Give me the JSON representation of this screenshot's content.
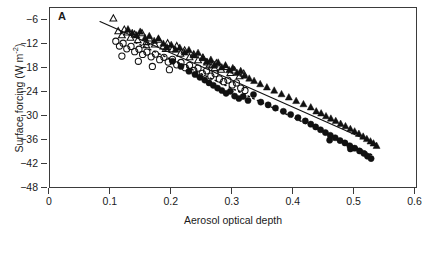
{
  "figure": {
    "panel_label": "A",
    "background": "#ffffff",
    "frame_color": "#3b3b3b",
    "marker_color": "#111111"
  },
  "axes": {
    "x": {
      "title": "Aerosol optical depth",
      "ticks": [
        "0",
        "0.1",
        "0.2",
        "0.3",
        "0.4",
        "0.5",
        "0.6"
      ],
      "tick_values": [
        0,
        0.1,
        0.2,
        0.3,
        0.4,
        0.5,
        0.6
      ],
      "min": 0,
      "max": 0.604
    },
    "y": {
      "title_main": "Surface forcing (W m",
      "title_sup": "-2",
      "title_tail": ")",
      "ticks": [
        "-6",
        "-12",
        "-18",
        "-24",
        "-30",
        "-36",
        "-42",
        "-48"
      ],
      "tick_values": [
        -6,
        -12,
        -18,
        -24,
        -30,
        -36,
        -42,
        -48
      ],
      "min": -48,
      "max": -2.8
    }
  },
  "chart_data": {
    "type": "scatter",
    "title": "",
    "subtitle": "",
    "xlabel": "Aerosol optical depth",
    "ylabel": "Surface forcing (W m-2)",
    "xlim": [
      0,
      0.604
    ],
    "ylim": [
      -48,
      -2.8
    ],
    "grid": false,
    "legend": "none",
    "panel": "A",
    "series": [
      {
        "name": "open-triangles",
        "marker": "triangle-open",
        "fit_line": "none",
        "points": [
          [
            0.104,
            -5.4
          ],
          [
            0.112,
            -8.6
          ],
          [
            0.118,
            -9.6
          ],
          [
            0.122,
            -8.2
          ],
          [
            0.127,
            -8.9
          ],
          [
            0.132,
            -10.2
          ],
          [
            0.139,
            -9.4
          ],
          [
            0.144,
            -10.8
          ],
          [
            0.151,
            -9.1
          ],
          [
            0.158,
            -11.3
          ],
          [
            0.163,
            -10.4
          ],
          [
            0.172,
            -11.9
          ],
          [
            0.178,
            -10.7
          ],
          [
            0.186,
            -12.4
          ],
          [
            0.193,
            -11.6
          ],
          [
            0.201,
            -13.1
          ],
          [
            0.208,
            -12.3
          ],
          [
            0.214,
            -14.2
          ],
          [
            0.221,
            -13.4
          ],
          [
            0.229,
            -15.1
          ],
          [
            0.236,
            -14.4
          ],
          [
            0.243,
            -15.8
          ],
          [
            0.251,
            -15.2
          ],
          [
            0.258,
            -16.4
          ],
          [
            0.266,
            -17.1
          ],
          [
            0.273,
            -16.6
          ],
          [
            0.281,
            -18.2
          ],
          [
            0.288,
            -17.5
          ],
          [
            0.296,
            -19.0
          ],
          [
            0.303,
            -18.4
          ],
          [
            0.311,
            -19.8
          ],
          [
            0.318,
            -19.2
          ],
          [
            0.262,
            -16.9
          ],
          [
            0.27,
            -17.8
          ],
          [
            0.158,
            -12.1
          ],
          [
            0.19,
            -13.0
          ]
        ]
      },
      {
        "name": "filled-triangles",
        "marker": "triangle-filled",
        "fit_line": "solid",
        "fit": {
          "x0": 0.082,
          "y0": -6.2,
          "x1": 0.536,
          "y1": -36.8
        },
        "points": [
          [
            0.128,
            -8.1
          ],
          [
            0.135,
            -9.0
          ],
          [
            0.142,
            -9.6
          ],
          [
            0.148,
            -8.7
          ],
          [
            0.156,
            -10.3
          ],
          [
            0.163,
            -9.8
          ],
          [
            0.171,
            -11.0
          ],
          [
            0.178,
            -10.4
          ],
          [
            0.186,
            -11.7
          ],
          [
            0.192,
            -12.6
          ],
          [
            0.199,
            -12.0
          ],
          [
            0.206,
            -13.2
          ],
          [
            0.213,
            -12.7
          ],
          [
            0.221,
            -13.9
          ],
          [
            0.228,
            -13.3
          ],
          [
            0.236,
            -14.6
          ],
          [
            0.243,
            -14.0
          ],
          [
            0.251,
            -15.3
          ],
          [
            0.257,
            -16.2
          ],
          [
            0.264,
            -15.7
          ],
          [
            0.27,
            -17.0
          ],
          [
            0.276,
            -16.4
          ],
          [
            0.282,
            -17.6
          ],
          [
            0.288,
            -17.1
          ],
          [
            0.294,
            -18.3
          ],
          [
            0.3,
            -17.8
          ],
          [
            0.307,
            -19.0
          ],
          [
            0.313,
            -18.5
          ],
          [
            0.319,
            -19.7
          ],
          [
            0.327,
            -20.4
          ],
          [
            0.335,
            -21.0
          ],
          [
            0.345,
            -21.8
          ],
          [
            0.356,
            -22.6
          ],
          [
            0.368,
            -23.4
          ],
          [
            0.38,
            -24.3
          ],
          [
            0.392,
            -25.1
          ],
          [
            0.404,
            -26.0
          ],
          [
            0.416,
            -26.8
          ],
          [
            0.428,
            -27.6
          ],
          [
            0.437,
            -28.6
          ],
          [
            0.445,
            -29.1
          ],
          [
            0.453,
            -29.8
          ],
          [
            0.461,
            -30.4
          ],
          [
            0.469,
            -31.0
          ],
          [
            0.477,
            -31.7
          ],
          [
            0.485,
            -32.3
          ],
          [
            0.493,
            -33.0
          ],
          [
            0.5,
            -33.6
          ],
          [
            0.507,
            -34.2
          ],
          [
            0.514,
            -34.9
          ],
          [
            0.52,
            -35.5
          ],
          [
            0.526,
            -36.1
          ],
          [
            0.531,
            -36.6
          ],
          [
            0.536,
            -37.2
          ]
        ]
      },
      {
        "name": "open-circles",
        "marker": "circle-open",
        "fit_line": "none",
        "points": [
          [
            0.108,
            -11.1
          ],
          [
            0.114,
            -12.3
          ],
          [
            0.12,
            -11.6
          ],
          [
            0.126,
            -13.0
          ],
          [
            0.133,
            -12.4
          ],
          [
            0.139,
            -13.7
          ],
          [
            0.146,
            -13.1
          ],
          [
            0.152,
            -14.4
          ],
          [
            0.159,
            -13.8
          ],
          [
            0.166,
            -15.0
          ],
          [
            0.173,
            -14.3
          ],
          [
            0.18,
            -15.7
          ],
          [
            0.187,
            -15.1
          ],
          [
            0.194,
            -16.3
          ],
          [
            0.201,
            -15.6
          ],
          [
            0.208,
            -17.0
          ],
          [
            0.215,
            -16.4
          ],
          [
            0.222,
            -17.7
          ],
          [
            0.229,
            -17.1
          ],
          [
            0.236,
            -18.4
          ],
          [
            0.243,
            -17.8
          ],
          [
            0.25,
            -19.1
          ],
          [
            0.257,
            -18.5
          ],
          [
            0.264,
            -19.8
          ],
          [
            0.271,
            -19.2
          ],
          [
            0.278,
            -20.5
          ],
          [
            0.285,
            -21.2
          ],
          [
            0.292,
            -20.8
          ],
          [
            0.299,
            -22.0
          ],
          [
            0.306,
            -21.5
          ],
          [
            0.313,
            -22.8
          ],
          [
            0.32,
            -23.4
          ],
          [
            0.118,
            -14.8
          ],
          [
            0.145,
            -16.1
          ],
          [
            0.168,
            -17.4
          ],
          [
            0.196,
            -18.2
          ]
        ]
      },
      {
        "name": "filled-circles",
        "marker": "circle-filled",
        "fit_line": "dashed",
        "fit": {
          "x0": 0.14,
          "y0": -11.4,
          "x1": 0.53,
          "y1": -39.6
        },
        "points": [
          [
            0.201,
            -16.1
          ],
          [
            0.215,
            -17.4
          ],
          [
            0.228,
            -18.6
          ],
          [
            0.238,
            -19.4
          ],
          [
            0.246,
            -20.1
          ],
          [
            0.254,
            -20.8
          ],
          [
            0.261,
            -21.5
          ],
          [
            0.268,
            -22.1
          ],
          [
            0.275,
            -22.8
          ],
          [
            0.282,
            -23.4
          ],
          [
            0.289,
            -24.1
          ],
          [
            0.296,
            -23.6
          ],
          [
            0.303,
            -24.8
          ],
          [
            0.31,
            -25.4
          ],
          [
            0.317,
            -24.9
          ],
          [
            0.325,
            -25.9
          ],
          [
            0.334,
            -24.4
          ],
          [
            0.346,
            -26.3
          ],
          [
            0.358,
            -27.0
          ],
          [
            0.37,
            -27.8
          ],
          [
            0.383,
            -28.6
          ],
          [
            0.395,
            -29.4
          ],
          [
            0.407,
            -30.2
          ],
          [
            0.419,
            -31.0
          ],
          [
            0.428,
            -31.8
          ],
          [
            0.436,
            -32.5
          ],
          [
            0.444,
            -33.2
          ],
          [
            0.452,
            -33.9
          ],
          [
            0.46,
            -34.6
          ],
          [
            0.468,
            -35.2
          ],
          [
            0.476,
            -35.9
          ],
          [
            0.484,
            -36.5
          ],
          [
            0.492,
            -37.2
          ],
          [
            0.5,
            -37.8
          ],
          [
            0.508,
            -38.5
          ],
          [
            0.515,
            -39.1
          ],
          [
            0.521,
            -39.8
          ],
          [
            0.527,
            -40.4
          ],
          [
            0.459,
            -35.8
          ],
          [
            0.493,
            -38.0
          ]
        ]
      }
    ]
  }
}
